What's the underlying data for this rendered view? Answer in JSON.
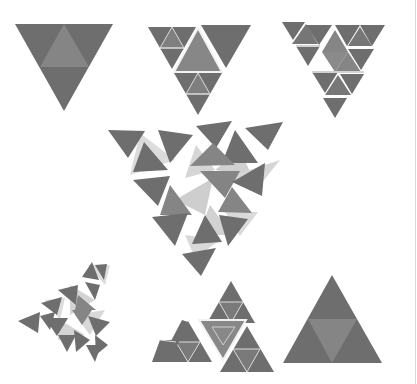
{
  "figure": {
    "colors": {
      "background": "#ffffff",
      "dark": "#6b6b6b",
      "mid": "#858585",
      "light": "#c8c8c8",
      "lighter": "#dcdcdc",
      "gap": "#f2f2f2"
    },
    "stages": [
      {
        "id": 1,
        "label": "inverted triangle, 4-part split"
      },
      {
        "id": 2,
        "label": "inverted triangle, partial subdivision"
      },
      {
        "id": 3,
        "label": "inverted triangle, full second-level subdivision, slight offset"
      },
      {
        "id": 4,
        "label": "exploded / rotated tiles (center)"
      },
      {
        "id": 5,
        "label": "rotated tiles, shrinking"
      },
      {
        "id": 6,
        "label": "upright triangle, second-level subdivision"
      },
      {
        "id": 7,
        "label": "upright triangle, 4-part split"
      }
    ]
  }
}
